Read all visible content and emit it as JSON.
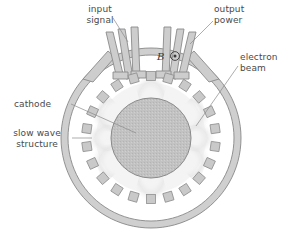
{
  "figure": {
    "background_color": "#ffffff"
  },
  "labels": {
    "input_signal": "input\nsignal",
    "output_power": "output\npower",
    "electron_beam": "electron\nbeam",
    "cathode": "cathode",
    "slow_wave_structure": "slow wave\nstructure",
    "magnetic_field_symbol": "B"
  },
  "colors": {
    "outline": "#8c8c8c",
    "wall_fill": "#cccccc",
    "cathode_fill": "#bfbfbf",
    "vane_fill": "#c9c9c9",
    "leader_line": "#8a8a8a",
    "text": "#4a4a4a",
    "spoke_glow": "#e4e4e4"
  },
  "geometry": {
    "center_x": 151,
    "center_y": 138,
    "outer_wall_outer_radius": 90,
    "outer_wall_inner_radius": 83,
    "vane_ring_radius": 62,
    "cathode_radius": 40,
    "vane_count": 22,
    "vane_size": 9,
    "electron_spoke_count": 8
  },
  "ports": {
    "input": {
      "name": "input signal",
      "bar_count": 3,
      "angle_deg": -118
    },
    "output": {
      "name": "output power",
      "bar_count": 3,
      "angle_deg": -62
    }
  }
}
